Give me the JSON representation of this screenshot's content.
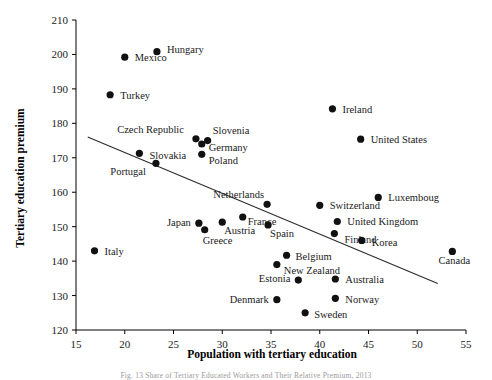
{
  "figure": {
    "caption": "Fig. 13  Share of Tertiary Educated Workers and Their Relative Premium, 2013"
  },
  "chart_data": {
    "type": "scatter",
    "title": "",
    "xlabel": "Population with tertiary education",
    "ylabel": "Tertiary education premium",
    "xlim": [
      15,
      55
    ],
    "ylim": [
      120,
      210
    ],
    "xticks": [
      15,
      20,
      25,
      30,
      35,
      40,
      45,
      50,
      55
    ],
    "yticks": [
      120,
      130,
      140,
      150,
      160,
      170,
      180,
      190,
      200,
      210
    ],
    "grid": false,
    "legend": "none",
    "marker_color": "#111111",
    "trendline": {
      "visible": true,
      "color": "#2b2b2b",
      "x_start": 16.2,
      "y_start": 176.0,
      "x_end": 52.1,
      "y_end": 133.5
    },
    "points": [
      {
        "label": "Mexico",
        "x": 20.0,
        "y": 199.2,
        "label_dx": 10,
        "label_dy": 4
      },
      {
        "label": "Hungary",
        "x": 23.3,
        "y": 200.8,
        "label_dx": 10,
        "label_dy": 1
      },
      {
        "label": "Turkey",
        "x": 18.5,
        "y": 188.3,
        "label_dx": 10,
        "label_dy": 4
      },
      {
        "label": "Ireland",
        "x": 41.3,
        "y": 184.2,
        "label_dx": 10,
        "label_dy": 4
      },
      {
        "label": "United States",
        "x": 44.2,
        "y": 175.4,
        "label_dx": 10,
        "label_dy": 4
      },
      {
        "label": "Czech Republic",
        "x": 27.3,
        "y": 175.5,
        "label_dx": -12,
        "label_dy": -6,
        "anchor": "end"
      },
      {
        "label": "Slovenia",
        "x": 28.5,
        "y": 175.0,
        "label_dx": 5,
        "label_dy": -7
      },
      {
        "label": "Germany",
        "x": 27.9,
        "y": 174.0,
        "label_dx": 7,
        "label_dy": 7
      },
      {
        "label": "Slovakia",
        "x": 21.5,
        "y": 171.3,
        "label_dx": 10,
        "label_dy": 6
      },
      {
        "label": "Poland",
        "x": 27.9,
        "y": 171.0,
        "label_dx": 7,
        "label_dy": 10
      },
      {
        "label": "Portugal",
        "x": 23.2,
        "y": 168.4,
        "label_dx": -10,
        "label_dy": 12,
        "anchor": "end"
      },
      {
        "label": "Luxemboug",
        "x": 46.0,
        "y": 158.5,
        "label_dx": 10,
        "label_dy": 0
      },
      {
        "label": "Netherlands",
        "x": 34.6,
        "y": 156.5,
        "label_dx": -3,
        "label_dy": -6,
        "anchor": "end"
      },
      {
        "label": "Switzerland",
        "x": 40.0,
        "y": 156.2,
        "label_dx": 10,
        "label_dy": 4
      },
      {
        "label": "United Kingdom",
        "x": 41.8,
        "y": 151.5,
        "label_dx": 10,
        "label_dy": 3
      },
      {
        "label": "Finland",
        "x": 41.5,
        "y": 148.0,
        "label_dx": 10,
        "label_dy": 9
      },
      {
        "label": "Korea",
        "x": 44.3,
        "y": 146.0,
        "label_dx": 10,
        "label_dy": 6
      },
      {
        "label": "France",
        "x": 32.1,
        "y": 152.8,
        "label_dx": 5,
        "label_dy": 8
      },
      {
        "label": "Austria",
        "x": 30.0,
        "y": 151.3,
        "label_dx": 2,
        "label_dy": 12
      },
      {
        "label": "Spain",
        "x": 34.7,
        "y": 150.5,
        "label_dx": 2,
        "label_dy": 12
      },
      {
        "label": "Japan",
        "x": 27.6,
        "y": 151.0,
        "label_dx": -8,
        "label_dy": 3,
        "anchor": "end"
      },
      {
        "label": "Greece",
        "x": 28.2,
        "y": 149.1,
        "label_dx": -2,
        "label_dy": 14
      },
      {
        "label": "Italy",
        "x": 16.9,
        "y": 143.0,
        "label_dx": 10,
        "label_dy": 4
      },
      {
        "label": "Canada",
        "x": 53.6,
        "y": 142.8,
        "label_dx": 2,
        "label_dy": 13,
        "anchor": "middle"
      },
      {
        "label": "Belgium",
        "x": 36.6,
        "y": 141.7,
        "label_dx": 9,
        "label_dy": 5
      },
      {
        "label": "New Zealand",
        "x": 35.6,
        "y": 139.0,
        "label_dx": 7,
        "label_dy": 9
      },
      {
        "label": "Australia",
        "x": 41.6,
        "y": 134.8,
        "label_dx": 10,
        "label_dy": 4
      },
      {
        "label": "Estonia",
        "x": 37.8,
        "y": 134.5,
        "label_dx": -8,
        "label_dy": 2,
        "anchor": "end"
      },
      {
        "label": "Norway",
        "x": 41.6,
        "y": 129.2,
        "label_dx": 10,
        "label_dy": 5
      },
      {
        "label": "Denmark",
        "x": 35.6,
        "y": 128.8,
        "label_dx": -8,
        "label_dy": 3,
        "anchor": "end"
      },
      {
        "label": "Sweden",
        "x": 38.5,
        "y": 125.0,
        "label_dx": 9,
        "label_dy": 5
      }
    ]
  }
}
